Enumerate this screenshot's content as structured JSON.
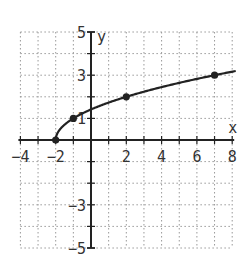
{
  "chart_data": {
    "type": "line",
    "title": "",
    "function": "y = sqrt(x + 2)",
    "xlabel": "x",
    "ylabel": "y",
    "xlim": [
      -4,
      8
    ],
    "ylim": [
      -5,
      5
    ],
    "grid": true,
    "x_ticks": [
      -4,
      -2,
      2,
      4,
      6,
      8
    ],
    "y_ticks": [
      5,
      3,
      1,
      -3,
      -5
    ],
    "points": [
      {
        "x": -2,
        "y": 0
      },
      {
        "x": -1,
        "y": 1
      },
      {
        "x": 2,
        "y": 2
      },
      {
        "x": 7,
        "y": 3
      }
    ],
    "curve_x_range": [
      -2,
      8.2
    ]
  },
  "colors": {
    "curve": "#222222",
    "axis": "#222222",
    "grid": "#999999",
    "text": "#333333"
  }
}
